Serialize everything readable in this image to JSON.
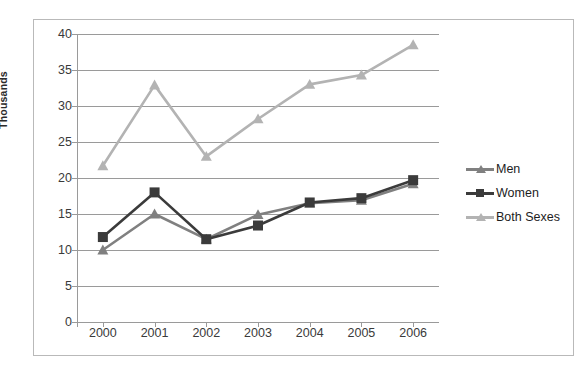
{
  "chart_data": {
    "type": "line",
    "title": "",
    "xlabel": "",
    "ylabel": "Thousands",
    "categories": [
      "2000",
      "2001",
      "2002",
      "2003",
      "2004",
      "2005",
      "2006"
    ],
    "ylim": [
      0,
      40
    ],
    "yticks": [
      0,
      5,
      10,
      15,
      20,
      25,
      30,
      35,
      40
    ],
    "grid": true,
    "legend_position": "right",
    "series": [
      {
        "name": "Men",
        "color": "#808080",
        "marker": "triangle",
        "values": [
          10.0,
          15.0,
          11.5,
          14.9,
          16.5,
          16.9,
          19.2
        ]
      },
      {
        "name": "Women",
        "color": "#3b3b3b",
        "marker": "square",
        "values": [
          11.8,
          18.0,
          11.5,
          13.4,
          16.6,
          17.2,
          19.7
        ]
      },
      {
        "name": "Both Sexes",
        "color": "#b3b3b3",
        "marker": "triangle",
        "values": [
          21.7,
          32.9,
          23.0,
          28.2,
          33.0,
          34.3,
          38.5
        ]
      }
    ]
  },
  "legend": {
    "items": [
      {
        "label": "Men"
      },
      {
        "label": "Women"
      },
      {
        "label": "Both Sexes"
      }
    ]
  },
  "axes": {
    "y_title": "Thousands"
  }
}
